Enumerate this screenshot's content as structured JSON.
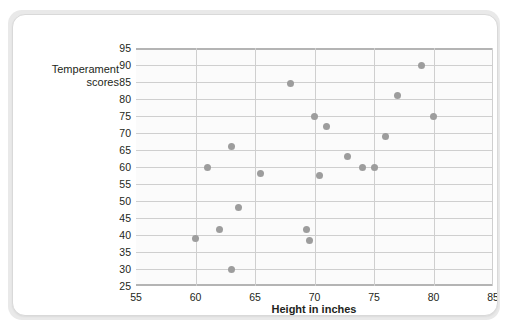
{
  "chart_data": {
    "type": "scatter",
    "title": "",
    "xlabel": "Height in inches",
    "ylabel": "Temperament scores",
    "ylabel_lines": [
      "Temperament",
      "scores"
    ],
    "xlim": [
      55,
      85
    ],
    "ylim": [
      25,
      95
    ],
    "xticks": [
      55,
      60,
      65,
      70,
      75,
      80,
      85
    ],
    "yticks": [
      25,
      30,
      35,
      40,
      45,
      50,
      55,
      60,
      65,
      70,
      75,
      80,
      85,
      90,
      95
    ],
    "xtick_labels": [
      "55",
      "60",
      "65",
      "70",
      "75",
      "80",
      "85"
    ],
    "ytick_labels": [
      "25",
      "30",
      "35",
      "40",
      "45",
      "50",
      "55",
      "60",
      "65",
      "70",
      "75",
      "80",
      "85",
      "90",
      "95"
    ],
    "grid": true,
    "grid_horizontal": true,
    "grid_vertical": true,
    "legend": null,
    "marker_color": "#9d9d9d",
    "marker_size": 7,
    "points": [
      {
        "x": 60.0,
        "y": 39
      },
      {
        "x": 61.0,
        "y": 60
      },
      {
        "x": 62.0,
        "y": 41.5
      },
      {
        "x": 63.0,
        "y": 30
      },
      {
        "x": 63.0,
        "y": 66
      },
      {
        "x": 63.6,
        "y": 48
      },
      {
        "x": 65.5,
        "y": 58
      },
      {
        "x": 68.0,
        "y": 84.5
      },
      {
        "x": 69.3,
        "y": 41.5
      },
      {
        "x": 69.6,
        "y": 38.5
      },
      {
        "x": 70.0,
        "y": 75
      },
      {
        "x": 70.4,
        "y": 57.5
      },
      {
        "x": 71.0,
        "y": 72
      },
      {
        "x": 72.8,
        "y": 63
      },
      {
        "x": 74.0,
        "y": 60
      },
      {
        "x": 75.0,
        "y": 60
      },
      {
        "x": 76.0,
        "y": 69
      },
      {
        "x": 77.0,
        "y": 81
      },
      {
        "x": 79.0,
        "y": 90
      },
      {
        "x": 80.0,
        "y": 75
      }
    ]
  },
  "colors": {
    "marker": "#9d9d9d",
    "grid": "#cfcfcf",
    "axis": "#b4b4b4",
    "text": "#231f20",
    "card_background": "#ffffff",
    "page_background": "#e9e9e9",
    "plot_background": "#fbfbfb"
  }
}
